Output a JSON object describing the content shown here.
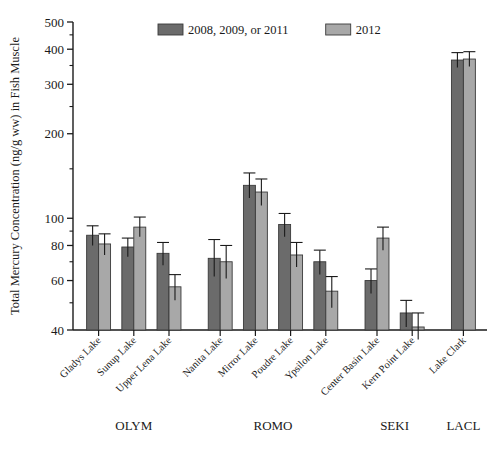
{
  "chart_data": {
    "type": "bar",
    "title": "",
    "xlabel": "",
    "ylabel": "Total Mercury Concentration (ng/g ww) in Fish Muscle",
    "yscale": "log",
    "ylim": [
      40,
      500
    ],
    "yticks": [
      40,
      60,
      80,
      100,
      200,
      300,
      400,
      500
    ],
    "ytick_labels": [
      "40",
      "60",
      "80",
      "100",
      "200",
      "300",
      "400",
      "500"
    ],
    "grid": false,
    "legend_position": "top-center",
    "categories": [
      "Gladys Lake",
      "Sunup Lake",
      "Upper Lena Lake",
      "Nanita Lake",
      "Mirror Lake",
      "Poudre Lake",
      "Ypsilon Lake",
      "Center Basin Lake",
      "Kern Point Lake",
      "Lake Clark"
    ],
    "groups": [
      {
        "label": "OLYM",
        "categories": [
          "Gladys Lake",
          "Sunup Lake",
          "Upper Lena Lake"
        ]
      },
      {
        "label": "ROMO",
        "categories": [
          "Nanita Lake",
          "Mirror Lake",
          "Poudre Lake",
          "Ypsilon Lake"
        ]
      },
      {
        "label": "SEKI",
        "categories": [
          "Center Basin Lake",
          "Kern Point Lake"
        ]
      },
      {
        "label": "LACL",
        "categories": [
          "Lake Clark"
        ]
      }
    ],
    "series": [
      {
        "name": "2008, 2009, or 2011",
        "color": "#6b6b6b",
        "values": [
          87,
          79,
          75,
          72,
          131,
          95,
          70,
          60,
          46,
          366
        ],
        "err_upper": [
          94,
          85,
          82,
          84,
          145,
          104,
          77,
          66,
          51,
          389
        ],
        "err_lower": [
          80,
          73,
          68,
          62,
          118,
          86,
          63,
          54,
          41,
          344
        ]
      },
      {
        "name": "2012",
        "color": "#a8a8a8",
        "values": [
          81,
          93,
          57,
          70,
          124,
          74,
          55,
          85,
          41,
          369
        ],
        "err_upper": [
          88,
          101,
          63,
          80,
          138,
          82,
          62,
          93,
          46,
          392
        ],
        "err_lower": [
          74,
          86,
          51,
          61,
          111,
          67,
          48,
          77,
          37,
          347
        ]
      }
    ]
  },
  "legend": {
    "items": [
      {
        "label": "2008, 2009, or 2011",
        "color": "#6b6b6b"
      },
      {
        "label": "2012",
        "color": "#a8a8a8"
      }
    ]
  },
  "axis": {
    "y_title": "Total Mercury Concentration (ng/g ww) in Fish Muscle"
  }
}
